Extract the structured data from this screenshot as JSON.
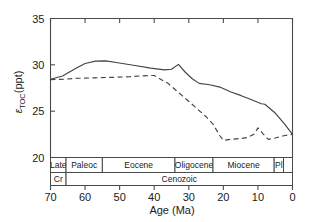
{
  "chart_data": {
    "type": "line",
    "title": "",
    "xlabel": "Age (Ma)",
    "ylabel": "εTOC(ppt)",
    "ylabel_main": "ε",
    "ylabel_sub": "TOC",
    "ylabel_unit": "(ppt)",
    "xlim": [
      70,
      0
    ],
    "ylim": [
      20,
      35
    ],
    "x_reversed": true,
    "grid": false,
    "legend": "none",
    "xticks": [
      70,
      60,
      50,
      40,
      30,
      20,
      10,
      0
    ],
    "xtick_labels": [
      "70",
      "60",
      "50",
      "40",
      "30",
      "20",
      "10",
      "0"
    ],
    "yticks": [
      20,
      25,
      30,
      35
    ],
    "ytick_labels": [
      "20",
      "25",
      "30",
      "35"
    ],
    "series": [
      {
        "name": "solid-curve",
        "style": "solid",
        "points": [
          [
            70.0,
            28.45
          ],
          [
            66.5,
            28.8
          ],
          [
            63.0,
            29.55
          ],
          [
            60.0,
            30.15
          ],
          [
            57.0,
            30.4
          ],
          [
            54.0,
            30.42
          ],
          [
            51.0,
            30.25
          ],
          [
            46.0,
            29.95
          ],
          [
            41.0,
            29.65
          ],
          [
            37.0,
            29.45
          ],
          [
            35.0,
            29.52
          ],
          [
            33.0,
            30.05
          ],
          [
            31.0,
            29.2
          ],
          [
            29.0,
            28.5
          ],
          [
            27.0,
            28.0
          ],
          [
            24.0,
            27.85
          ],
          [
            21.0,
            27.6
          ],
          [
            18.0,
            27.1
          ],
          [
            15.0,
            26.7
          ],
          [
            12.0,
            26.25
          ],
          [
            9.0,
            25.8
          ],
          [
            8.0,
            25.75
          ],
          [
            5.0,
            24.8
          ],
          [
            2.5,
            23.7
          ],
          [
            0.0,
            22.5
          ]
        ]
      },
      {
        "name": "dashed-curve",
        "style": "dashed",
        "points": [
          [
            70.0,
            28.4
          ],
          [
            66.0,
            28.45
          ],
          [
            62.0,
            28.55
          ],
          [
            57.0,
            28.6
          ],
          [
            52.0,
            28.65
          ],
          [
            47.0,
            28.72
          ],
          [
            44.0,
            28.8
          ],
          [
            41.0,
            28.85
          ],
          [
            40.0,
            28.85
          ],
          [
            36.0,
            28.0
          ],
          [
            32.0,
            26.7
          ],
          [
            28.0,
            25.4
          ],
          [
            25.0,
            24.4
          ],
          [
            23.0,
            23.6
          ],
          [
            21.0,
            22.35
          ],
          [
            20.0,
            21.85
          ],
          [
            18.0,
            21.95
          ],
          [
            15.0,
            22.05
          ],
          [
            13.0,
            22.15
          ],
          [
            11.0,
            22.55
          ],
          [
            10.0,
            23.2
          ],
          [
            8.5,
            22.55
          ],
          [
            7.0,
            21.95
          ],
          [
            5.0,
            22.1
          ],
          [
            2.5,
            22.35
          ],
          [
            0.0,
            22.5
          ]
        ]
      }
    ],
    "timescale": {
      "epoch_row": [
        {
          "label": "Late",
          "start": 70.0,
          "end": 65.5
        },
        {
          "label": "Paleoc",
          "start": 65.5,
          "end": 55.0
        },
        {
          "label": "Eocene",
          "start": 55.0,
          "end": 34.0
        },
        {
          "label": "Oligocene",
          "start": 34.0,
          "end": 23.0
        },
        {
          "label": "Miocene",
          "start": 23.0,
          "end": 5.3
        },
        {
          "label": "Pl",
          "start": 5.3,
          "end": 2.6
        },
        {
          "label": "",
          "start": 2.6,
          "end": 0.0
        }
      ],
      "era_row": [
        {
          "label": "Cr",
          "start": 70.0,
          "end": 65.5
        },
        {
          "label": "Cenozoic",
          "start": 65.5,
          "end": 0.0
        }
      ]
    }
  }
}
